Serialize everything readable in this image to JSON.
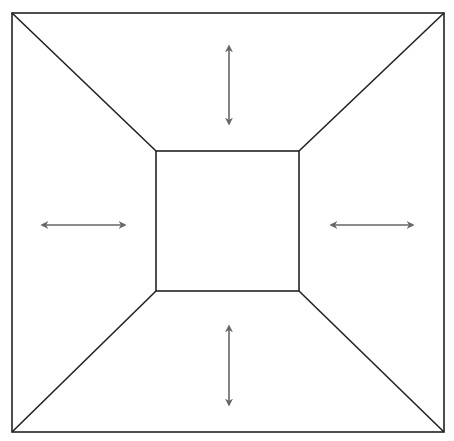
{
  "diagram": {
    "title": "",
    "colors": {
      "frame": "#222222",
      "arrow": "#666666",
      "background": "#ffffff"
    },
    "outer_square": {
      "x1": 12,
      "y1": 13,
      "x2": 444,
      "y2": 432
    },
    "inner_square": {
      "x1": 156,
      "y1": 151,
      "x2": 299,
      "y2": 291
    },
    "arrows": [
      {
        "name": "top",
        "direction": "vertical",
        "x1": 229,
        "y1": 46,
        "x2": 229,
        "y2": 124
      },
      {
        "name": "left",
        "direction": "horizontal",
        "x1": 42,
        "y1": 225,
        "x2": 125,
        "y2": 225
      },
      {
        "name": "right",
        "direction": "horizontal",
        "x1": 331,
        "y1": 225,
        "x2": 413,
        "y2": 225
      },
      {
        "name": "bottom",
        "direction": "vertical",
        "x1": 229,
        "y1": 326,
        "x2": 229,
        "y2": 405
      }
    ]
  }
}
